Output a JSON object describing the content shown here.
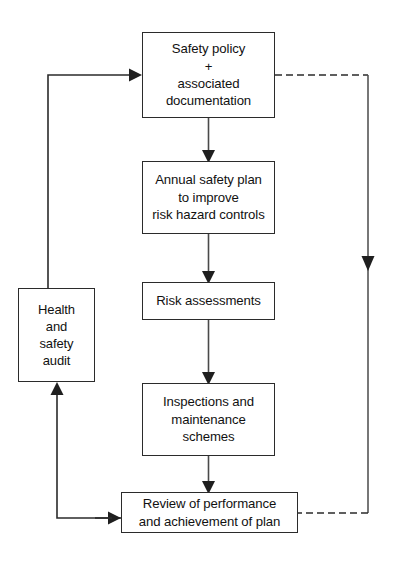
{
  "diagram": {
    "line_color": "#2b2b2b",
    "background": "#ffffff",
    "nodes": {
      "safety_policy": {
        "label": "Safety policy\n+\nassociated\ndocumentation"
      },
      "annual_plan": {
        "label": "Annual safety plan\nto improve\nrisk hazard controls"
      },
      "risk_assessments": {
        "label": "Risk assessments"
      },
      "inspections": {
        "label": "Inspections and\nmaintenance\nschemes"
      },
      "review": {
        "label": "Review of performance\nand achievement of plan"
      },
      "audit": {
        "label": "Health\nand\nsafety\naudit"
      }
    },
    "connectors": [
      {
        "id": "policy-to-plan",
        "from": "safety_policy",
        "to": "annual_plan",
        "style": "solid",
        "arrow": "down"
      },
      {
        "id": "plan-to-risk",
        "from": "annual_plan",
        "to": "risk_assessments",
        "style": "solid",
        "arrow": "down"
      },
      {
        "id": "risk-to-inspections",
        "from": "risk_assessments",
        "to": "inspections",
        "style": "solid",
        "arrow": "down"
      },
      {
        "id": "inspections-to-review",
        "from": "inspections",
        "to": "review",
        "style": "solid",
        "arrow": "down"
      },
      {
        "id": "review-to-audit",
        "from": "review",
        "to": "audit",
        "style": "solid",
        "arrow": "up"
      },
      {
        "id": "audit-to-policy",
        "from": "audit",
        "to": "safety_policy",
        "style": "solid",
        "arrow": "right"
      },
      {
        "id": "policy-to-review",
        "from": "safety_policy",
        "to": "review",
        "style": "dashed",
        "arrow": "down"
      }
    ]
  }
}
